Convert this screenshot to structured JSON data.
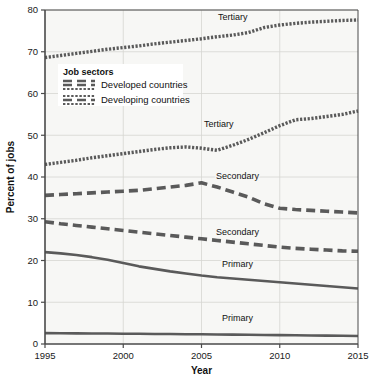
{
  "chart_data": {
    "type": "line",
    "title": "",
    "xlabel": "Year",
    "ylabel": "Percent of jobs",
    "xlim": [
      1995,
      2015
    ],
    "ylim": [
      0,
      80
    ],
    "xticks": [
      "1995",
      "2000",
      "2005",
      "2010",
      "2015"
    ],
    "yticks": [
      "0",
      "10",
      "20",
      "30",
      "40",
      "50",
      "60",
      "70",
      "80"
    ],
    "grid": true,
    "legend": {
      "title": "Job sectors",
      "position": "upper-left-inside",
      "entries": [
        {
          "name": "Developed countries",
          "style": "dashed"
        },
        {
          "name": "Developing countries",
          "style": "dotted"
        }
      ]
    },
    "x": [
      1995,
      1996,
      1997,
      1998,
      1999,
      2000,
      2001,
      2002,
      2003,
      2004,
      2005,
      2006,
      2007,
      2008,
      2009,
      2010,
      2011,
      2012,
      2013,
      2014,
      2015
    ],
    "series": [
      {
        "name": "Tertiary",
        "group": "Developed countries",
        "style": "dotted",
        "label": "Tertiary",
        "label_x": 2007,
        "label_y": 77.5,
        "values": [
          68.6,
          69.1,
          69.6,
          70.1,
          70.6,
          71.0,
          71.4,
          71.9,
          72.3,
          72.7,
          73.1,
          73.6,
          74.0,
          74.6,
          75.8,
          76.4,
          76.8,
          77.1,
          77.3,
          77.5,
          77.6
        ]
      },
      {
        "name": "Secondary",
        "group": "Developed countries",
        "style": "dashed",
        "label": "Secondary",
        "label_x": 2007.3,
        "label_y": 39.5,
        "values": [
          35.6,
          35.8,
          36.0,
          36.2,
          36.4,
          36.6,
          36.8,
          37.2,
          37.6,
          38.0,
          38.6,
          37.6,
          36.4,
          35.2,
          33.6,
          32.5,
          32.2,
          32.0,
          31.8,
          31.6,
          31.4
        ]
      },
      {
        "name": "Primary",
        "group": "Developed countries",
        "style": "solid",
        "label": "Primary",
        "label_x": 2007.3,
        "label_y": 18.5,
        "values": [
          22.0,
          21.7,
          21.3,
          20.8,
          20.2,
          19.4,
          18.6,
          18.0,
          17.4,
          16.9,
          16.4,
          16.0,
          15.7,
          15.4,
          15.1,
          14.8,
          14.5,
          14.2,
          13.9,
          13.6,
          13.3
        ]
      },
      {
        "name": "Tertiary",
        "group": "Developing countries",
        "style": "dotted",
        "label": "Tertiary",
        "label_x": 2006.1,
        "label_y": 52.0,
        "values": [
          43.0,
          43.5,
          44.0,
          44.6,
          45.1,
          45.6,
          46.1,
          46.6,
          47.0,
          47.2,
          46.9,
          46.4,
          47.6,
          49.0,
          50.6,
          52.3,
          53.7,
          54.0,
          54.5,
          55.0,
          55.8
        ]
      },
      {
        "name": "Secondary",
        "group": "Developing countries",
        "style": "dashed",
        "label": "Secondary",
        "label_x": 2007.3,
        "label_y": 26.0,
        "values": [
          29.3,
          28.8,
          28.4,
          28.0,
          27.6,
          27.2,
          26.8,
          26.4,
          26.0,
          25.6,
          25.2,
          24.8,
          24.4,
          24.0,
          23.6,
          23.2,
          22.9,
          22.7,
          22.5,
          22.3,
          22.2
        ]
      },
      {
        "name": "Primary",
        "group": "Developing countries",
        "style": "solid",
        "label": "Primary",
        "label_x": 2007.3,
        "label_y": 5.5,
        "values": [
          2.6,
          2.58,
          2.55,
          2.52,
          2.5,
          2.47,
          2.44,
          2.41,
          2.38,
          2.35,
          2.32,
          2.28,
          2.24,
          2.2,
          2.16,
          2.12,
          2.08,
          2.04,
          2.0,
          1.96,
          1.9
        ]
      }
    ],
    "colors": {
      "plot_background": "#f7f7f5",
      "grid": "#d6d6d2",
      "axis": "#4a4a4a",
      "line": "#5a5a5a",
      "text": "#111111"
    }
  }
}
